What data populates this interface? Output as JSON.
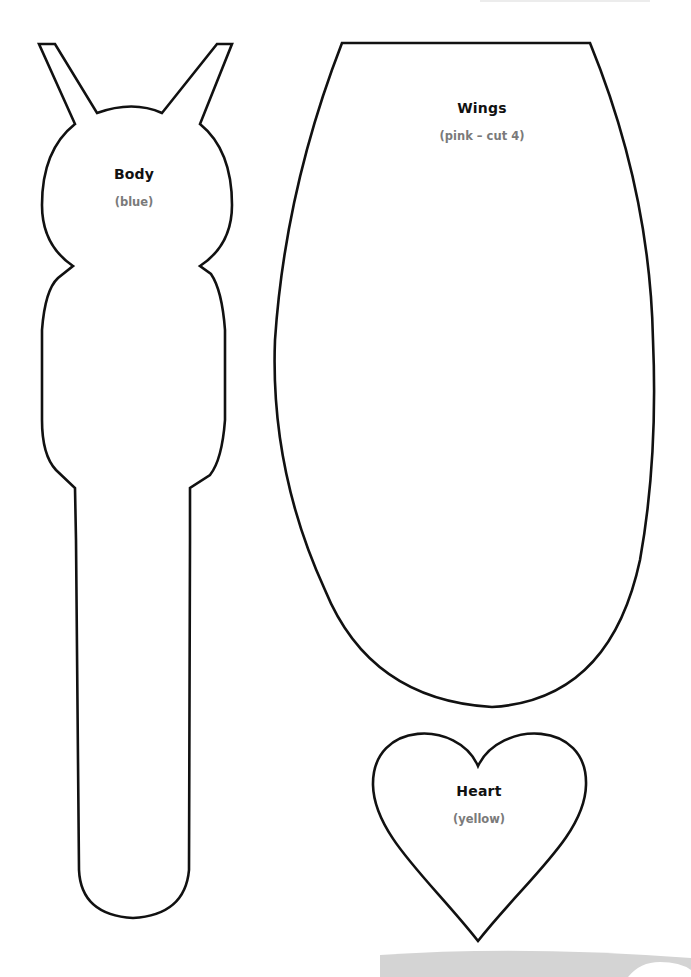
{
  "document": {
    "type": "craft cut-out template",
    "stroke_color": "#111111",
    "footer_band_color": "#d4d4d4"
  },
  "pieces": [
    {
      "id": "body",
      "title": "Body",
      "subtitle": "(blue)"
    },
    {
      "id": "wings",
      "title": "Wings",
      "subtitle": "(pink – cut 4)"
    },
    {
      "id": "heart",
      "title": "Heart",
      "subtitle": "(yellow)"
    }
  ]
}
